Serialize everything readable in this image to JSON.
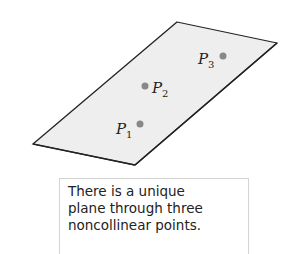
{
  "figure": {
    "plane": {
      "vertices": [
        [
          177,
          22
        ],
        [
          277,
          43
        ],
        [
          135,
          165
        ],
        [
          33,
          144
        ]
      ],
      "fill": "#eeeeee",
      "stroke": "#222222"
    },
    "points": [
      {
        "name": "P",
        "subscript": "1",
        "x": 140,
        "y": 124,
        "label_x": 116,
        "label_y": 134
      },
      {
        "name": "P",
        "subscript": "2",
        "x": 145,
        "y": 86,
        "label_x": 152,
        "label_y": 93
      },
      {
        "name": "P",
        "subscript": "3",
        "x": 223,
        "y": 56,
        "label_x": 198,
        "label_y": 64
      }
    ],
    "point_color": "#888888"
  },
  "caption": {
    "lines": [
      "There is a unique",
      "plane through three",
      "noncollinear points."
    ]
  }
}
